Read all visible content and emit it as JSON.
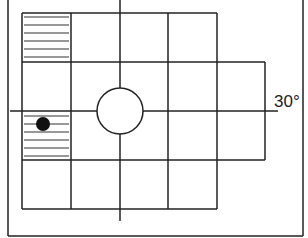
{
  "diagram": {
    "type": "grid-plan",
    "angle_label": "30°",
    "colors": {
      "line": "#222222",
      "background": "#ffffff",
      "dot": "#111111"
    },
    "grid": {
      "columns_x": [
        22,
        71,
        120,
        168,
        217,
        265
      ],
      "rows_y": [
        13,
        62,
        111,
        160,
        209
      ],
      "hatched_cells": [
        {
          "col": 1,
          "row": 1
        },
        {
          "col": 1,
          "row": 3
        }
      ]
    },
    "circle": {
      "cx": 120,
      "cy": 111,
      "r": 23
    },
    "dot": {
      "cx": 43,
      "cy": 124,
      "r": 7
    },
    "axes": {
      "vertical": {
        "x": 120,
        "y1": 0,
        "y2": 221
      },
      "horizontal": {
        "y": 111,
        "x1": 10,
        "x2": 278
      }
    }
  }
}
